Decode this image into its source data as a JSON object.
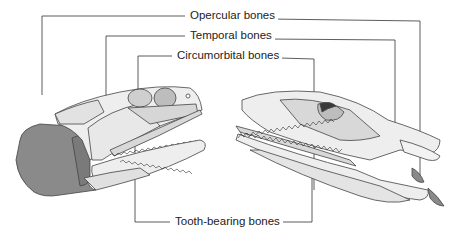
{
  "figure": {
    "labels": {
      "opercular": "Opercular bones",
      "temporal": "Temporal bones",
      "circumorbital": "Circumorbital bones",
      "tooth_bearing": "Tooth-bearing bones"
    },
    "colors": {
      "line": "#333333",
      "bone_light": "#eeeeee",
      "bone_mid": "#d8d8d8",
      "bone_dark": "#bdbdbd",
      "opercular_fill": "#8a8a8a",
      "outline": "#444444"
    }
  }
}
